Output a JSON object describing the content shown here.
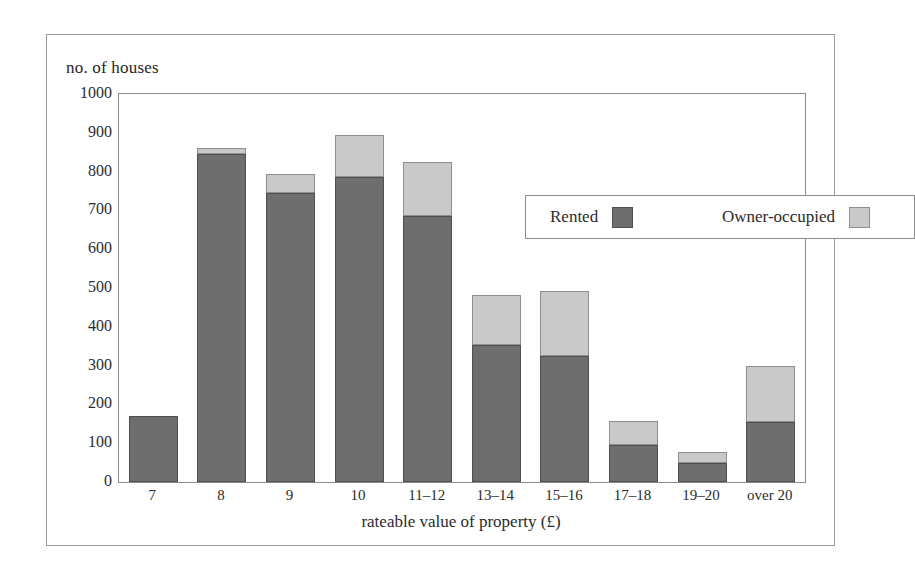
{
  "figure": {
    "frame_color": "#9a9a9a",
    "background": "#ffffff"
  },
  "chart_data": {
    "type": "bar",
    "subtype": "stacked-bar",
    "title": "",
    "xlabel": "rateable value of property (£)",
    "ylabel": "no. of houses",
    "ylim": [
      0,
      1000
    ],
    "ytick_step": 100,
    "yticks": [
      "1000",
      "900",
      "800",
      "700",
      "600",
      "500",
      "400",
      "300",
      "200",
      "100",
      "0"
    ],
    "grid": false,
    "legend_position": "inside-top-right",
    "categories": [
      "7",
      "8",
      "9",
      "10",
      "11–12",
      "13–14",
      "15–16",
      "17–18",
      "19–20",
      "over 20"
    ],
    "series": [
      {
        "name": "Rented",
        "color": "#6e6e6e",
        "values": [
          170,
          845,
          745,
          785,
          685,
          352,
          325,
          95,
          48,
          155
        ]
      },
      {
        "name": "Owner-occupied",
        "color": "#c9c9c9",
        "values": [
          0,
          15,
          50,
          110,
          140,
          130,
          168,
          63,
          30,
          143
        ]
      }
    ],
    "totals": [
      170,
      860,
      795,
      895,
      825,
      482,
      493,
      158,
      78,
      298
    ]
  },
  "legend": {
    "entries": [
      {
        "label": "Rented",
        "swatch": "dark-gray-swatch"
      },
      {
        "label": "Owner-occupied",
        "swatch": "light-gray-swatch"
      }
    ]
  }
}
